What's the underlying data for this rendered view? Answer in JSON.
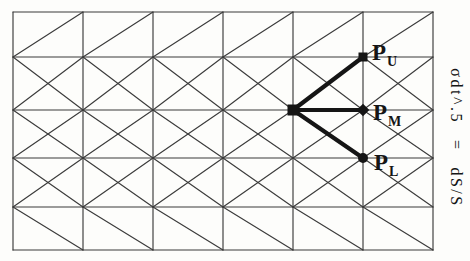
{
  "figure": {
    "colors": {
      "background": "#fdfdfb",
      "grid_line": "#3b3b3b",
      "bold": "#151515",
      "text": "#151515"
    },
    "grid": {
      "x_lines": [
        13,
        83,
        153,
        223,
        293,
        363,
        433
      ],
      "y_lines": [
        12,
        57,
        110,
        158,
        207,
        250
      ],
      "row_patterns": [
        "/",
        "X",
        "X",
        "X",
        "\\"
      ],
      "line_width": 1.15
    },
    "tree": {
      "root": {
        "x": 293,
        "y": 110,
        "marker": "square",
        "size": 11
      },
      "branch_width": 4.2,
      "targets": [
        {
          "id": "PU",
          "x": 363,
          "y": 57,
          "marker": "square",
          "size": 9,
          "label": "P",
          "subscript": "U",
          "label_dx": 9,
          "label_dy": -16
        },
        {
          "id": "PM",
          "x": 363,
          "y": 110,
          "marker": "diamond",
          "size": 9,
          "label": "P",
          "subscript": "M",
          "label_dx": 10,
          "label_dy": -9
        },
        {
          "id": "PL",
          "x": 363,
          "y": 158,
          "marker": "circle",
          "size": 9,
          "label": "P",
          "subscript": "L",
          "label_dx": 11,
          "label_dy": -7
        }
      ]
    },
    "annotation": {
      "lhs": "σdt^.5",
      "eq": "=",
      "rhs": "dS/S"
    }
  }
}
